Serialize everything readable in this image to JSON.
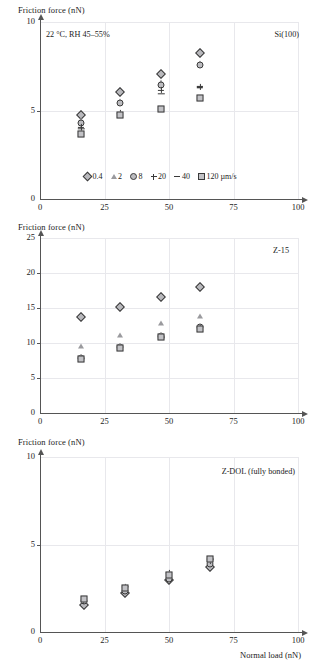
{
  "figure": {
    "shared_xlabel": "Normal load (nN)",
    "shared_ylabel": "Friction force (nN)",
    "legend_units_suffix": "µm/s"
  },
  "legend": {
    "entries": [
      {
        "marker": "diamond",
        "label": "0.4"
      },
      {
        "marker": "triangle",
        "label": "2"
      },
      {
        "marker": "circle",
        "label": "8"
      },
      {
        "marker": "plus",
        "label": "20"
      },
      {
        "marker": "dash",
        "label": "40"
      },
      {
        "marker": "square",
        "label": "120 µm/s"
      }
    ]
  },
  "chart_data": [
    {
      "type": "scatter",
      "title": "Si(100)",
      "annotation": "22 °C, RH 45–55%",
      "xlabel": "",
      "ylabel": "Friction force (nN)",
      "xlim": [
        0,
        100
      ],
      "ylim": [
        0,
        10
      ],
      "xticks": [
        0,
        25,
        50,
        75,
        100
      ],
      "yticks": [
        0,
        5,
        10
      ],
      "grid": true,
      "x": [
        16,
        31,
        47,
        62
      ],
      "series": [
        {
          "name": "0.4",
          "marker": "diamond",
          "values": [
            4.75,
            6.05,
            7.05,
            8.25
          ]
        },
        {
          "name": "2",
          "marker": "triangle",
          "values": [
            4.45,
            5.55,
            6.6,
            7.7
          ]
        },
        {
          "name": "8",
          "marker": "circle",
          "values": [
            4.3,
            5.45,
            6.45,
            7.55
          ]
        },
        {
          "name": "20",
          "marker": "plus",
          "values": [
            4.05,
            4.85,
            6.15,
            6.35
          ]
        },
        {
          "name": "40",
          "marker": "dash",
          "values": [
            3.95,
            4.8,
            5.95,
            6.3
          ]
        },
        {
          "name": "120",
          "marker": "square",
          "values": [
            3.7,
            4.75,
            5.1,
            5.7
          ]
        }
      ]
    },
    {
      "type": "scatter",
      "title": "Z-15",
      "annotation": "",
      "xlabel": "",
      "ylabel": "Friction force (nN)",
      "xlim": [
        0,
        100
      ],
      "ylim": [
        0,
        25
      ],
      "xticks": [
        0,
        25,
        50,
        75,
        100
      ],
      "yticks": [
        0,
        5,
        10,
        15,
        20,
        25
      ],
      "grid": true,
      "x": [
        16,
        31,
        47,
        62
      ],
      "series": [
        {
          "name": "0.4",
          "marker": "diamond",
          "values": [
            13.7,
            15.1,
            16.6,
            18.0
          ]
        },
        {
          "name": "2",
          "marker": "triangle",
          "values": [
            9.6,
            11.1,
            12.8,
            13.9
          ]
        },
        {
          "name": "8",
          "marker": "circle",
          "values": [
            7.9,
            9.5,
            11.0,
            12.3
          ]
        },
        {
          "name": "20",
          "marker": "plus",
          "values": [
            7.8,
            9.3,
            10.9,
            12.2
          ]
        },
        {
          "name": "40",
          "marker": "dash",
          "values": [
            7.7,
            9.2,
            10.8,
            12.1
          ]
        },
        {
          "name": "120",
          "marker": "square",
          "values": [
            7.7,
            9.3,
            10.9,
            12.0
          ]
        }
      ]
    },
    {
      "type": "scatter",
      "title": "Z-DOL (fully bonded)",
      "annotation": "",
      "xlabel": "Normal load (nN)",
      "ylabel": "Friction force (nN)",
      "xlim": [
        0,
        100
      ],
      "ylim": [
        0,
        10
      ],
      "xticks": [
        0,
        25,
        50,
        75,
        100
      ],
      "yticks": [
        0,
        5,
        10
      ],
      "grid": true,
      "x": [
        17,
        33,
        50,
        66
      ],
      "series": [
        {
          "name": "0.4",
          "marker": "diamond",
          "values": [
            1.55,
            2.25,
            2.95,
            3.7
          ]
        },
        {
          "name": "2",
          "marker": "triangle",
          "values": [
            1.95,
            2.45,
            3.15,
            3.95
          ]
        },
        {
          "name": "8",
          "marker": "circle",
          "values": [
            1.75,
            2.35,
            3.05,
            3.9
          ]
        },
        {
          "name": "20",
          "marker": "plus",
          "values": [
            1.8,
            2.55,
            3.35,
            4.05
          ]
        },
        {
          "name": "40",
          "marker": "dash",
          "values": [
            1.85,
            2.6,
            3.4,
            4.15
          ]
        },
        {
          "name": "120",
          "marker": "square",
          "values": [
            1.9,
            2.5,
            3.25,
            4.2
          ]
        }
      ]
    }
  ]
}
